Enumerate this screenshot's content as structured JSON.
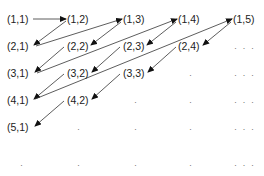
{
  "diagram": {
    "nodes": [
      {
        "id": "1-1",
        "label": "(1,1)",
        "x": 7,
        "y": 23
      },
      {
        "id": "1-2",
        "label": "(1,2)",
        "x": 67,
        "y": 23
      },
      {
        "id": "1-3",
        "label": "(1,3)",
        "x": 123,
        "y": 23
      },
      {
        "id": "1-4",
        "label": "(1,4)",
        "x": 178,
        "y": 23
      },
      {
        "id": "1-5",
        "label": "(1,5)",
        "x": 233,
        "y": 23
      },
      {
        "id": "2-1",
        "label": "(2,1)",
        "x": 7,
        "y": 50
      },
      {
        "id": "2-2",
        "label": "(2,2)",
        "x": 67,
        "y": 50
      },
      {
        "id": "2-3",
        "label": "(2,3)",
        "x": 123,
        "y": 50
      },
      {
        "id": "2-4",
        "label": "(2,4)",
        "x": 178,
        "y": 50
      },
      {
        "id": "3-1",
        "label": "(3,1)",
        "x": 7,
        "y": 77
      },
      {
        "id": "3-2",
        "label": "(3,2)",
        "x": 67,
        "y": 77
      },
      {
        "id": "3-3",
        "label": "(3,3)",
        "x": 123,
        "y": 77
      },
      {
        "id": "4-1",
        "label": "(4,1)",
        "x": 7,
        "y": 104
      },
      {
        "id": "4-2",
        "label": "(4,2)",
        "x": 67,
        "y": 104
      },
      {
        "id": "5-1",
        "label": "(5,1)",
        "x": 7,
        "y": 131
      }
    ],
    "dots": [
      {
        "label": "· · ·",
        "x": 234,
        "y": 51
      },
      {
        "label": "·",
        "x": 189,
        "y": 78
      },
      {
        "label": "· · ·",
        "x": 234,
        "y": 78
      },
      {
        "label": "·",
        "x": 134,
        "y": 105
      },
      {
        "label": "·",
        "x": 189,
        "y": 105
      },
      {
        "label": "· · ·",
        "x": 234,
        "y": 105
      },
      {
        "label": "·",
        "x": 77,
        "y": 132
      },
      {
        "label": "·",
        "x": 134,
        "y": 132
      },
      {
        "label": "·",
        "x": 189,
        "y": 132
      },
      {
        "label": "· · ·",
        "x": 234,
        "y": 132
      },
      {
        "label": "·",
        "x": 20,
        "y": 168
      },
      {
        "label": "·",
        "x": 77,
        "y": 168
      },
      {
        "label": "·",
        "x": 134,
        "y": 168
      },
      {
        "label": "·",
        "x": 189,
        "y": 168
      },
      {
        "label": "· · ·",
        "x": 234,
        "y": 168
      }
    ],
    "edges": [
      {
        "from": "(1,1)",
        "to": "(1,2)",
        "x1": 33,
        "y1": 19,
        "x2": 66,
        "y2": 19
      },
      {
        "from": "(1,2)",
        "to": "(2,1)",
        "x1": 66,
        "y1": 21,
        "x2": 34,
        "y2": 45
      },
      {
        "from": "(2,1)",
        "to": "(1,3)",
        "x1": 36,
        "y1": 46,
        "x2": 122,
        "y2": 19
      },
      {
        "from": "(1,3)",
        "to": "(2,2)",
        "x1": 121,
        "y1": 22,
        "x2": 91,
        "y2": 45
      },
      {
        "from": "(2,2)",
        "to": "(3,1)",
        "x1": 64,
        "y1": 47,
        "x2": 35,
        "y2": 72
      },
      {
        "from": "(3,1)",
        "to": "(1,4)",
        "x1": 37,
        "y1": 73,
        "x2": 177,
        "y2": 19
      },
      {
        "from": "(1,4)",
        "to": "(2,3)",
        "x1": 176,
        "y1": 22,
        "x2": 147,
        "y2": 45
      },
      {
        "from": "(2,3)",
        "to": "(3,2)",
        "x1": 120,
        "y1": 47,
        "x2": 92,
        "y2": 72
      },
      {
        "from": "(3,2)",
        "to": "(4,1)",
        "x1": 64,
        "y1": 74,
        "x2": 34,
        "y2": 99
      },
      {
        "from": "(4,1)",
        "to": "(1,5)",
        "x1": 35,
        "y1": 99,
        "x2": 232,
        "y2": 19
      },
      {
        "from": "(1,5)",
        "to": "(2,4)",
        "x1": 231,
        "y1": 22,
        "x2": 203,
        "y2": 45
      },
      {
        "from": "(2,4)",
        "to": "(3,3)",
        "x1": 176,
        "y1": 47,
        "x2": 148,
        "y2": 72
      },
      {
        "from": "(3,3)",
        "to": "(4,2)",
        "x1": 120,
        "y1": 74,
        "x2": 92,
        "y2": 99
      },
      {
        "from": "(4,2)",
        "to": "(5,1)",
        "x1": 64,
        "y1": 101,
        "x2": 35,
        "y2": 126
      }
    ]
  }
}
